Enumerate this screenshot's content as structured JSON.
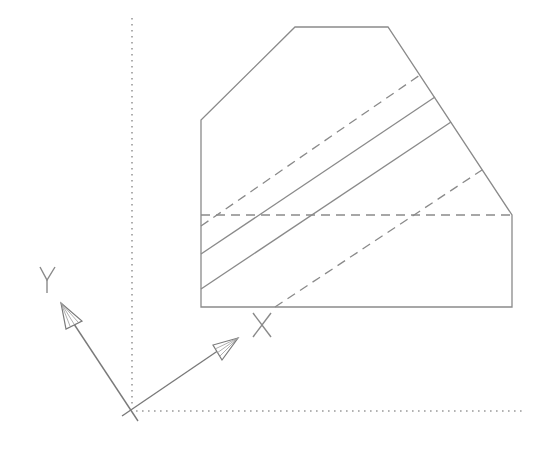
{
  "drawing": {
    "type": "cad-viewport",
    "line_color": "#8a8a8a",
    "background": "#ffffff",
    "shape": {
      "outline_vertices": [
        [
          201,
          307
        ],
        [
          201,
          120
        ],
        [
          295,
          27
        ],
        [
          388,
          27
        ],
        [
          512,
          215
        ],
        [
          512,
          307
        ]
      ],
      "hidden_edge": {
        "from": [
          201,
          215
        ],
        "to": [
          512,
          215
        ],
        "style": "dashed"
      },
      "diagonal_lines": [
        {
          "style": "dashed",
          "from": [
            201,
            226
          ],
          "to": [
            420,
            75
          ]
        },
        {
          "style": "solid",
          "from": [
            201,
            254
          ],
          "to": [
            435,
            97
          ]
        },
        {
          "style": "solid",
          "from": [
            201,
            289
          ],
          "to": [
            451,
            122
          ]
        },
        {
          "style": "dashed",
          "from": [
            275,
            307
          ],
          "to": [
            482,
            170
          ]
        }
      ]
    },
    "grid_axes": {
      "vertical": {
        "from": [
          132,
          18
        ],
        "to": [
          132,
          410
        ],
        "style": "dotted"
      },
      "horizontal": {
        "from": [
          132,
          411
        ],
        "to": [
          525,
          411
        ],
        "style": "dotted"
      }
    },
    "ucs_icon": {
      "origin": [
        132,
        410
      ],
      "x_axis": {
        "label": "X",
        "tip": [
          238,
          338
        ]
      },
      "y_axis": {
        "label": "Y",
        "tip": [
          61,
          303
        ]
      }
    }
  }
}
